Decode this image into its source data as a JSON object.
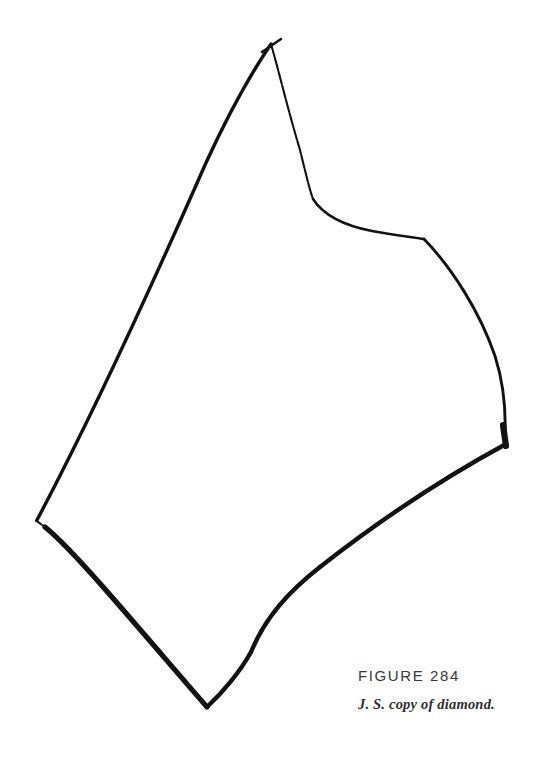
{
  "page": {
    "background_color": "#ffffff",
    "width": 544,
    "height": 757
  },
  "figure": {
    "number_label": "FIGURE 284",
    "caption": "J. S. copy of diamond.",
    "number_color": "#39393b",
    "caption_color": "#2e2e30",
    "ink_color": "#121212",
    "drawing_name": "hand-drawn diamond quadrilateral",
    "vertices": [
      {
        "name": "top-apex",
        "x": 272,
        "y": 42
      },
      {
        "name": "right-corner",
        "x": 505,
        "y": 440
      },
      {
        "name": "bottom-apex",
        "x": 206,
        "y": 707
      },
      {
        "name": "left-vertex",
        "x": 36,
        "y": 522
      }
    ],
    "strokes": [
      {
        "name": "top-right-edge",
        "from": "top-apex",
        "to": "right-corner",
        "weight": "thin, broken in places",
        "note": "S-curved: dips steeply from apex, shoulder near (312,200), corner near (424,238), then bows outward to the right corner"
      },
      {
        "name": "bottom-right-edge",
        "from": "right-corner",
        "to": "bottom-apex",
        "weight": "medium-heavy",
        "note": "gently curved, slight bend near (250,655)"
      },
      {
        "name": "bottom-left-edge",
        "from": "bottom-apex",
        "to": "left-vertex",
        "weight": "heavy near bottom apex, fading near the left vertex"
      },
      {
        "name": "top-left-edge",
        "from": "left-vertex",
        "to": "top-apex",
        "weight": "medium, long and slightly curved"
      },
      {
        "name": "apex-overshoot-tick",
        "from": "top-apex",
        "to": "overshoot",
        "weight": "short stray tick extending right of the apex"
      }
    ]
  }
}
